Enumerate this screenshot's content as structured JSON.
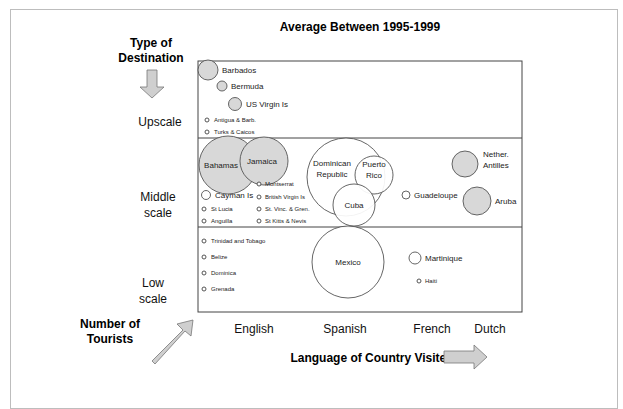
{
  "chart_data": {
    "type": "bubble",
    "title": "Average Between 1995-1999",
    "xlabel": "Language of Country Visited",
    "ylabel": "Type of Destination",
    "size_label": "Number of Tourists",
    "x_categories": [
      "English",
      "Spanish",
      "French",
      "Dutch"
    ],
    "y_categories": [
      "Upscale",
      "Middle scale",
      "Low scale"
    ],
    "y_labels_display": [
      [
        "Upscale"
      ],
      [
        "Middle",
        "scale"
      ],
      [
        "Low",
        "scale"
      ]
    ],
    "ylabel_lines": [
      "Type of",
      "Destination"
    ],
    "size_label_lines": [
      "Number of",
      "Tourists"
    ],
    "grid": false,
    "colors": {
      "gray_fill": "#d8d8d8",
      "white_fill": "#ffffff",
      "stroke": "#555555",
      "arrow_fill": "#cfcfcf"
    },
    "points": [
      {
        "name": "Barbados",
        "label_lines": [
          "Barbados"
        ],
        "language": "English",
        "tier": "Upscale",
        "relative_size": 3,
        "fill": "gray",
        "col": 0.05,
        "row": 0.1
      },
      {
        "name": "Bermuda",
        "label_lines": [
          "Bermuda"
        ],
        "language": "English",
        "tier": "Upscale",
        "relative_size": 1.6,
        "fill": "gray"
      },
      {
        "name": "US Virgin Is",
        "label_lines": [
          "US Virgin Is"
        ],
        "language": "English",
        "tier": "Upscale",
        "relative_size": 2,
        "fill": "gray"
      },
      {
        "name": "Antigua & Barb.",
        "label_lines": [
          "Antigua & Barb."
        ],
        "language": "English",
        "tier": "Upscale",
        "relative_size": 0.6,
        "fill": "white"
      },
      {
        "name": "Turks & Caicos",
        "label_lines": [
          "Turks & Caicos"
        ],
        "language": "English",
        "tier": "Upscale",
        "relative_size": 0.6,
        "fill": "white"
      },
      {
        "name": "Bahamas",
        "label_lines": [
          "Bahamas"
        ],
        "language": "English",
        "tier": "Middle scale",
        "relative_size": 9,
        "fill": "gray"
      },
      {
        "name": "Jamaica",
        "label_lines": [
          "Jamaica"
        ],
        "language": "English",
        "tier": "Middle scale",
        "relative_size": 7.5,
        "fill": "gray"
      },
      {
        "name": "Cayman Is",
        "label_lines": [
          "Cayman Is"
        ],
        "language": "English",
        "tier": "Middle scale",
        "relative_size": 1.6,
        "fill": "white"
      },
      {
        "name": "Montserrat",
        "label_lines": [
          "Montserrat"
        ],
        "language": "English",
        "tier": "Middle scale",
        "relative_size": 0.6,
        "fill": "white"
      },
      {
        "name": "British Virgin Is",
        "label_lines": [
          "British Virgin Is"
        ],
        "language": "English",
        "tier": "Middle scale",
        "relative_size": 0.6,
        "fill": "white"
      },
      {
        "name": "St Lucia",
        "label_lines": [
          "St Lucia"
        ],
        "language": "English",
        "tier": "Middle scale",
        "relative_size": 0.6,
        "fill": "white"
      },
      {
        "name": "St. Vinc. & Gren.",
        "label_lines": [
          "St. Vinc. & Gren."
        ],
        "language": "English",
        "tier": "Middle scale",
        "relative_size": 0.6,
        "fill": "white"
      },
      {
        "name": "Anguilla",
        "label_lines": [
          "Anguilla"
        ],
        "language": "English",
        "tier": "Middle scale",
        "relative_size": 0.6,
        "fill": "white"
      },
      {
        "name": "St Kitts & Nevis",
        "label_lines": [
          "St Kitts & Nevis"
        ],
        "language": "English",
        "tier": "Middle scale",
        "relative_size": 0.6,
        "fill": "white"
      },
      {
        "name": "Dominican Republic",
        "label_lines": [
          "Dominican",
          "Republic"
        ],
        "language": "Spanish",
        "tier": "Middle scale",
        "relative_size": 13,
        "fill": "white"
      },
      {
        "name": "Puerto Rico",
        "label_lines": [
          "Puerto",
          "Rico"
        ],
        "language": "Spanish",
        "tier": "Middle scale",
        "relative_size": 6.5,
        "fill": "white"
      },
      {
        "name": "Cuba",
        "label_lines": [
          "Cuba"
        ],
        "language": "Spanish",
        "tier": "Middle scale",
        "relative_size": 6.5,
        "fill": "white"
      },
      {
        "name": "Guadeloupe",
        "label_lines": [
          "Guadeloupe"
        ],
        "language": "French",
        "tier": "Middle scale",
        "relative_size": 1.4,
        "fill": "white"
      },
      {
        "name": "Nether. Antilles",
        "label_lines": [
          "Nether.",
          "Antilles"
        ],
        "language": "Dutch",
        "tier": "Middle scale",
        "relative_size": 3.5,
        "fill": "gray"
      },
      {
        "name": "Aruba",
        "label_lines": [
          "Aruba"
        ],
        "language": "Dutch",
        "tier": "Middle scale",
        "relative_size": 4,
        "fill": "gray"
      },
      {
        "name": "Trinidad and Tobago",
        "label_lines": [
          "Trinidad and Tobago"
        ],
        "language": "English",
        "tier": "Low scale",
        "relative_size": 0.6,
        "fill": "white"
      },
      {
        "name": "Belize",
        "label_lines": [
          "Belize"
        ],
        "language": "English",
        "tier": "Low scale",
        "relative_size": 0.6,
        "fill": "white"
      },
      {
        "name": "Dominica",
        "label_lines": [
          "Dominica"
        ],
        "language": "English",
        "tier": "Low scale",
        "relative_size": 0.6,
        "fill": "white"
      },
      {
        "name": "Grenada",
        "label_lines": [
          "Grenada"
        ],
        "language": "English",
        "tier": "Low scale",
        "relative_size": 0.6,
        "fill": "white"
      },
      {
        "name": "Mexico",
        "label_lines": [
          "Mexico"
        ],
        "language": "Spanish",
        "tier": "Low scale",
        "relative_size": 19,
        "fill": "white"
      },
      {
        "name": "Martinique",
        "label_lines": [
          "Martinique"
        ],
        "language": "French",
        "tier": "Low scale",
        "relative_size": 2,
        "fill": "white"
      },
      {
        "name": "Haiti",
        "label_lines": [
          "Haiti"
        ],
        "language": "French",
        "tier": "Low scale",
        "relative_size": 0.6,
        "fill": "white"
      }
    ]
  }
}
